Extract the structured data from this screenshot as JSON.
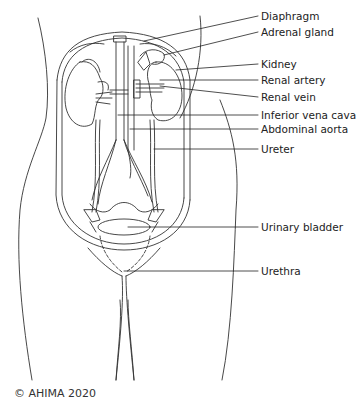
{
  "figure": {
    "type": "anatomical-diagram",
    "line_color": "#333333",
    "background": "#ffffff"
  },
  "labels": [
    {
      "id": "diaphragm",
      "text": "Diaphragm",
      "x": 261,
      "y": 10
    },
    {
      "id": "adrenal-gland",
      "text": "Adrenal gland",
      "x": 261,
      "y": 26
    },
    {
      "id": "kidney",
      "text": "Kidney",
      "x": 261,
      "y": 58
    },
    {
      "id": "renal-artery",
      "text": "Renal artery",
      "x": 261,
      "y": 74
    },
    {
      "id": "renal-vein",
      "text": "Renal vein",
      "x": 261,
      "y": 92
    },
    {
      "id": "inferior-vena-cava",
      "text": "Inferior vena cava",
      "x": 261,
      "y": 109
    },
    {
      "id": "abdominal-aorta",
      "text": "Abdominal aorta",
      "x": 261,
      "y": 124
    },
    {
      "id": "ureter",
      "text": "Ureter",
      "x": 261,
      "y": 144
    },
    {
      "id": "urinary-bladder",
      "text": "Urinary bladder",
      "x": 261,
      "y": 221
    },
    {
      "id": "urethra",
      "text": "Urethra",
      "x": 261,
      "y": 265
    }
  ],
  "copyright": "© AHIMA 2020"
}
